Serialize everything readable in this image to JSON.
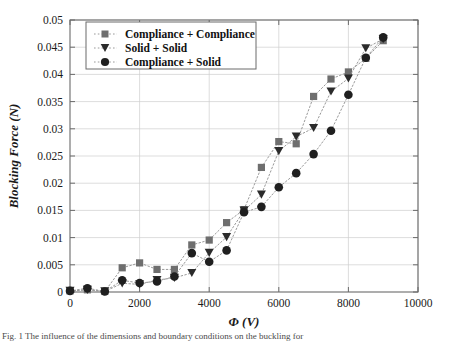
{
  "figure": {
    "caption": "Fig. 1  The influence of the dimensions and boundary conditions on the buckling for",
    "background_color": "#ffffff"
  },
  "chart_data": {
    "type": "scatter",
    "title": "",
    "xlabel": "Φ   (V)",
    "ylabel": "Blocking  Force  (N)",
    "xlim": [
      0,
      10000
    ],
    "ylim": [
      0,
      0.05
    ],
    "xticks": [
      0,
      2000,
      4000,
      6000,
      8000,
      10000
    ],
    "xticklabels": [
      "0",
      "2000",
      "4000",
      "6000",
      "8000",
      "10000"
    ],
    "yticks": [
      0,
      0.005,
      0.01,
      0.015,
      0.02,
      0.025,
      0.03,
      0.035,
      0.04,
      0.045,
      0.05
    ],
    "yticklabels": [
      "0",
      "0.005",
      "0.01",
      "0.015",
      "0.02",
      "0.025",
      "0.03",
      "0.035",
      "0.04",
      "0.045",
      "0.05"
    ],
    "grid": true,
    "legend_position": "upper left",
    "x": [
      0,
      500,
      1000,
      1500,
      2000,
      2500,
      3000,
      3500,
      4000,
      4500,
      5000,
      5500,
      6000,
      6500,
      7000,
      7500,
      8000,
      8500,
      9000
    ],
    "series": [
      {
        "name": "Compliance + Compliance",
        "marker": "square",
        "color": "#6e6e6e",
        "line_color": "#9a9a9a",
        "values": [
          0.0002,
          0.0004,
          0.0001,
          0.00445,
          0.00535,
          0.00415,
          0.00415,
          0.00865,
          0.00955,
          0.01275,
          0.01515,
          0.0229,
          0.02765,
          0.02725,
          0.03595,
          0.03915,
          0.04045,
          0.04295,
          0.0462
        ]
      },
      {
        "name": "Solid + Solid",
        "marker": "triangle-down",
        "color": "#2b2b2b",
        "line_color": "#9a9a9a",
        "values": [
          0.0002,
          0.0004,
          0.0001,
          0.0016,
          0.0014,
          0.0022,
          0.0026,
          0.0035,
          0.0072,
          0.0101,
          0.01495,
          0.0179,
          0.0259,
          0.02855,
          0.03015,
          0.03685,
          0.03925,
          0.0448,
          0.0465
        ]
      },
      {
        "name": "Compliance + Solid",
        "marker": "circle",
        "color": "#1f1f1f",
        "line_color": "#9a9a9a",
        "values": [
          0.0002,
          0.0007,
          0.0001,
          0.00215,
          0.00165,
          0.00195,
          0.00285,
          0.00715,
          0.00555,
          0.00765,
          0.01465,
          0.01565,
          0.01925,
          0.02185,
          0.02535,
          0.02965,
          0.03625,
          0.04305,
          0.0468
        ]
      }
    ]
  },
  "legend": {
    "items": [
      {
        "label": "Compliance + Compliance",
        "marker": "square"
      },
      {
        "label": "Solid + Solid",
        "marker": "triangle-down"
      },
      {
        "label": "Compliance + Solid",
        "marker": "circle"
      }
    ]
  },
  "colors": {
    "axis": "#6b6b6b",
    "grid": "#cfcfcf",
    "text": "#1a1a1a",
    "square_marker": "#6e6e6e",
    "triangle_marker": "#2b2b2b",
    "circle_marker": "#1f1f1f",
    "dotted_line": "#9a9a9a"
  }
}
